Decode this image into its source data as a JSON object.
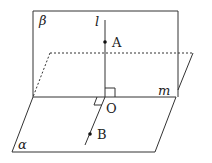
{
  "diagram": {
    "labels": {
      "plane_beta": "β",
      "plane_alpha": "α",
      "line_l": "l",
      "line_m": "m",
      "point_A": "A",
      "point_O": "O",
      "point_B": "B"
    },
    "colors": {
      "stroke": "#333333",
      "background": "#ffffff"
    }
  }
}
